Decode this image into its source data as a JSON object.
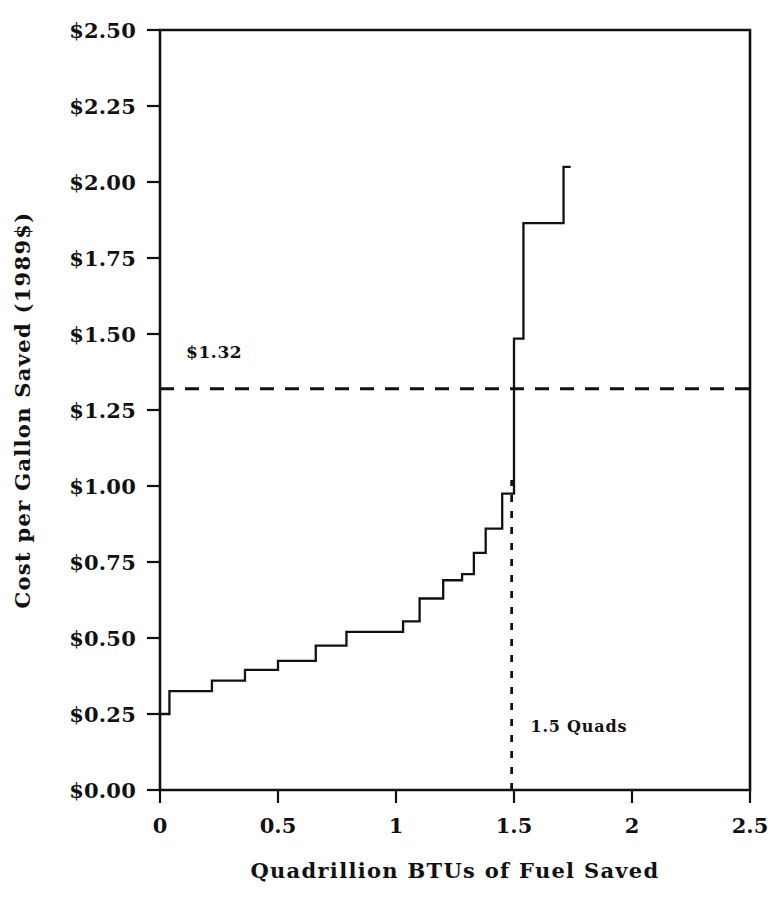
{
  "chart_data": {
    "type": "line",
    "subtype": "step",
    "title": "",
    "xlabel": "Quadrillion BTUs of Fuel Saved",
    "ylabel": "Cost per Gallon Saved (1989$)",
    "xlim": [
      0,
      2.5
    ],
    "ylim": [
      0,
      2.5
    ],
    "xticks": [
      0,
      0.5,
      1,
      1.5,
      2,
      2.5
    ],
    "xtick_labels": [
      "0",
      "0.5",
      "1",
      "1.5",
      "2",
      "2.5"
    ],
    "yticks": [
      0,
      0.25,
      0.5,
      0.75,
      1.0,
      1.25,
      1.5,
      1.75,
      2.0,
      2.25,
      2.5
    ],
    "ytick_labels": [
      "$0.00",
      "$0.25",
      "$0.50",
      "$0.75",
      "$1.00",
      "$1.25",
      "$1.50",
      "$1.75",
      "$2.00",
      "$2.25",
      "$2.50"
    ],
    "grid": false,
    "legend": "none",
    "series": [
      {
        "name": "Cost of conserved fuel supply curve",
        "style": "solid-step",
        "points": [
          {
            "x": 0.0,
            "y": 0.25
          },
          {
            "x": 0.04,
            "y": 0.25
          },
          {
            "x": 0.04,
            "y": 0.325
          },
          {
            "x": 0.22,
            "y": 0.325
          },
          {
            "x": 0.22,
            "y": 0.36
          },
          {
            "x": 0.36,
            "y": 0.36
          },
          {
            "x": 0.36,
            "y": 0.395
          },
          {
            "x": 0.5,
            "y": 0.395
          },
          {
            "x": 0.5,
            "y": 0.425
          },
          {
            "x": 0.66,
            "y": 0.425
          },
          {
            "x": 0.66,
            "y": 0.475
          },
          {
            "x": 0.79,
            "y": 0.475
          },
          {
            "x": 0.79,
            "y": 0.52
          },
          {
            "x": 1.03,
            "y": 0.52
          },
          {
            "x": 1.03,
            "y": 0.555
          },
          {
            "x": 1.1,
            "y": 0.555
          },
          {
            "x": 1.1,
            "y": 0.63
          },
          {
            "x": 1.2,
            "y": 0.63
          },
          {
            "x": 1.2,
            "y": 0.69
          },
          {
            "x": 1.28,
            "y": 0.69
          },
          {
            "x": 1.28,
            "y": 0.71
          },
          {
            "x": 1.33,
            "y": 0.71
          },
          {
            "x": 1.33,
            "y": 0.78
          },
          {
            "x": 1.38,
            "y": 0.78
          },
          {
            "x": 1.38,
            "y": 0.86
          },
          {
            "x": 1.45,
            "y": 0.86
          },
          {
            "x": 1.45,
            "y": 0.975
          },
          {
            "x": 1.5,
            "y": 0.975
          },
          {
            "x": 1.5,
            "y": 1.485
          },
          {
            "x": 1.54,
            "y": 1.485
          },
          {
            "x": 1.54,
            "y": 1.865
          },
          {
            "x": 1.71,
            "y": 1.865
          },
          {
            "x": 1.71,
            "y": 2.05
          },
          {
            "x": 1.74,
            "y": 2.05
          }
        ]
      }
    ],
    "annotations": [
      {
        "name": "threshold-price-line",
        "label": "$1.32",
        "orientation": "horizontal",
        "value": 1.32,
        "style": "dashed",
        "label_x": 0.11,
        "label_y": 1.42
      },
      {
        "name": "quads-marker-line",
        "label": "1.5 Quads",
        "orientation": "vertical",
        "value": 1.49,
        "style": "dotted",
        "label_x": 1.57,
        "label_y": 0.19
      }
    ]
  }
}
